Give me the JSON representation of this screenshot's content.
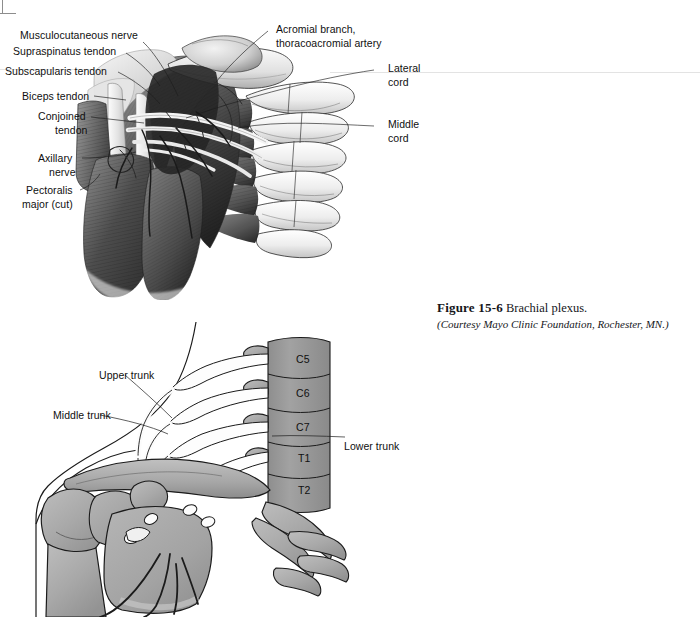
{
  "figure": {
    "caption_number": "Figure 15-6",
    "caption_title": "Brachial plexus.",
    "caption_credit": "(Courtesy Mayo Clinic Foundation, Rochester, MN.)"
  },
  "upper_illustration": {
    "name": "shoulder-dissection-anterior-view",
    "labels_left": [
      {
        "id": "musculocutaneous-nerve",
        "text": "Musculocutaneous nerve"
      },
      {
        "id": "supraspinatus-tendon",
        "text": "Supraspinatus tendon"
      },
      {
        "id": "subscapularis-tendon",
        "text": "Subscapularis tendon"
      },
      {
        "id": "biceps-tendon",
        "text": "Biceps tendon"
      },
      {
        "id": "conjoined-tendon-line1",
        "text": "Conjoined"
      },
      {
        "id": "conjoined-tendon-line2",
        "text": "tendon"
      },
      {
        "id": "axillary-nerve-line1",
        "text": "Axillary"
      },
      {
        "id": "axillary-nerve-line2",
        "text": "nerve"
      },
      {
        "id": "pectoralis-major-line1",
        "text": "Pectoralis"
      },
      {
        "id": "pectoralis-major-line2",
        "text": "major (cut)"
      }
    ],
    "labels_right": [
      {
        "id": "acromial-branch-line1",
        "text": "Acromial branch,"
      },
      {
        "id": "acromial-branch-line2",
        "text": "thoracoacromial artery"
      },
      {
        "id": "lateral-cord-line1",
        "text": "Lateral"
      },
      {
        "id": "lateral-cord-line2",
        "text": "cord"
      },
      {
        "id": "middle-cord-line1",
        "text": "Middle"
      },
      {
        "id": "middle-cord-line2",
        "text": "cord"
      }
    ]
  },
  "lower_diagram": {
    "name": "brachial-plexus-schematic",
    "labels_left": [
      {
        "id": "upper-trunk",
        "text": "Upper trunk"
      },
      {
        "id": "middle-trunk",
        "text": "Middle trunk"
      }
    ],
    "labels_right": [
      {
        "id": "lower-trunk",
        "text": "Lower trunk"
      }
    ],
    "vertebrae": [
      {
        "id": "c5",
        "text": "C5"
      },
      {
        "id": "c6",
        "text": "C6"
      },
      {
        "id": "c7",
        "text": "C7"
      },
      {
        "id": "t1",
        "text": "T1"
      },
      {
        "id": "t2",
        "text": "T2"
      }
    ]
  },
  "colors": {
    "page_background": "#ffffff",
    "bone_fill": "#a9a9a9",
    "bone_fill_light": "#bdbdbd",
    "vertebra_fill": "#9a9a9a",
    "outline": "#1b1b1b",
    "nerve_fill": "#fbfbfb",
    "label_text": "#101010",
    "caption_text": "#15161a",
    "muscle_dark": "#3a3a3a",
    "muscle_mid": "#6e6e6e",
    "rib_light": "#f2f2f2"
  }
}
